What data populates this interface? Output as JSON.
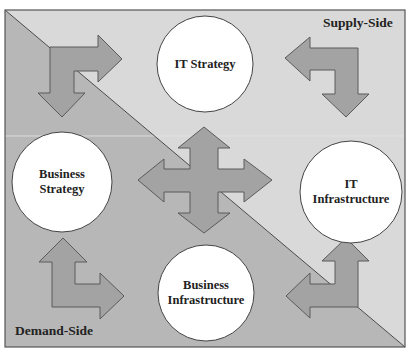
{
  "diagram": {
    "type": "strategic-alignment-model",
    "colors": {
      "supply_side_bg": "#d9d9d9",
      "demand_side_bg": "#b7b7b7",
      "arrow_fill": "#a3a3a3",
      "arrow_stroke": "#5a5a5a",
      "circle_fill": "#ffffff",
      "circle_stroke": "#444444",
      "frame_stroke": "#555555",
      "text": "#222222"
    },
    "regions": {
      "supply_side": {
        "label": "Supply-Side"
      },
      "demand_side": {
        "label": "Demand-Side"
      }
    },
    "nodes": [
      {
        "id": "it-strategy",
        "label_lines": [
          "IT Strategy"
        ],
        "cx": 205,
        "cy": 64,
        "r": 48
      },
      {
        "id": "it-infrastructure",
        "label_lines": [
          "IT",
          "Infrastructure"
        ],
        "cx": 351,
        "cy": 192,
        "r": 51
      },
      {
        "id": "business-strategy",
        "label_lines": [
          "Business",
          "Strategy"
        ],
        "cx": 62,
        "cy": 182,
        "r": 50
      },
      {
        "id": "business-infrastructure",
        "label_lines": [
          "Business",
          "Infrastructure"
        ],
        "cx": 206,
        "cy": 293,
        "r": 48
      }
    ],
    "labels": {
      "it_strategy": "IT Strategy",
      "it_infrastructure_line1": "IT",
      "it_infrastructure_line2": "Infrastructure",
      "business_strategy_line1": "Business",
      "business_strategy_line2": "Strategy",
      "business_infrastructure_line1": "Business",
      "business_infrastructure_line2": "Infrastructure",
      "supply_side": "Supply-Side",
      "demand_side": "Demand-Side"
    },
    "arrows": [
      {
        "id": "top-left-arrow",
        "directions": [
          "right",
          "down"
        ]
      },
      {
        "id": "top-right-arrow",
        "directions": [
          "left",
          "down"
        ]
      },
      {
        "id": "bottom-left-arrow",
        "directions": [
          "up",
          "right"
        ]
      },
      {
        "id": "bottom-right-arrow",
        "directions": [
          "up",
          "left"
        ]
      },
      {
        "id": "center-arrow",
        "directions": [
          "up",
          "down",
          "left",
          "right"
        ]
      }
    ]
  }
}
